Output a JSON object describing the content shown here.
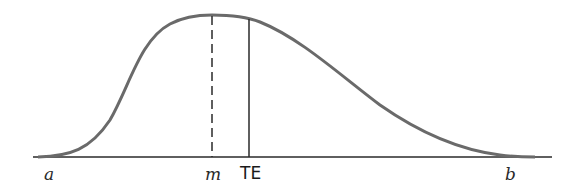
{
  "diagram": {
    "type": "probability-distribution",
    "labels": {
      "a": "a",
      "m": "m",
      "te": "TE",
      "b": "b"
    },
    "colors": {
      "curve": "#6a6a6a",
      "axis": "#2a2a2a",
      "lines": "#2a2a2a",
      "background": "#ffffff"
    }
  }
}
